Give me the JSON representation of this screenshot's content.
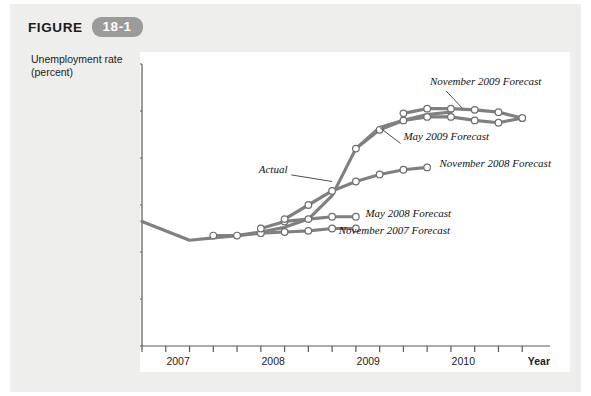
{
  "figure": {
    "label": "FIGURE",
    "number": "18-1",
    "badge_color": "#9b9b99",
    "card_background": "#eeeeec",
    "panel_background": "#ffffff"
  },
  "chart_data": {
    "type": "line",
    "title": "",
    "xlabel": "Year",
    "ylabel": "Unemployment rate (percent)",
    "ylim": [
      0,
      12
    ],
    "yticks": [
      0,
      2,
      4,
      6,
      8,
      10,
      12
    ],
    "xlim": [
      2006.75,
      2011.0
    ],
    "xticks": [
      2006.75,
      2007.0,
      2007.25,
      2007.5,
      2007.75,
      2008.0,
      2008.25,
      2008.5,
      2008.75,
      2009.0,
      2009.25,
      2009.5,
      2009.75,
      2010.0,
      2010.25,
      2010.5,
      2010.75
    ],
    "xtick_labels": [
      "2007",
      "2008",
      "2009",
      "2010"
    ],
    "xtick_label_positions": [
      2007.0,
      2008.0,
      2009.0,
      2010.0
    ],
    "grid": false,
    "legend_position": "inline-annotations",
    "line_color": "#808080",
    "marker_fill": "#ffffff",
    "marker_edge": "#6e6e6e",
    "series": [
      {
        "name": "Actual",
        "label": "Actual",
        "markers": false,
        "x": [
          2006.75,
          2007.25,
          2007.5,
          2007.75,
          2008.0,
          2008.25,
          2008.5,
          2008.75,
          2009.0,
          2009.25,
          2009.5,
          2009.75,
          2010.0
        ],
        "values": [
          5.3,
          4.5,
          4.6,
          4.7,
          4.85,
          5.05,
          5.4,
          6.4,
          8.4,
          9.3,
          9.6,
          9.85,
          9.95
        ]
      },
      {
        "name": "November 2007 Forecast",
        "label": "November 2007 Forecast",
        "markers": true,
        "x": [
          2007.5,
          2007.75,
          2008.0,
          2008.25,
          2008.5,
          2008.75,
          2009.0
        ],
        "values": [
          4.7,
          4.7,
          4.8,
          4.85,
          4.9,
          5.0,
          5.0
        ]
      },
      {
        "name": "May 2008 Forecast",
        "label": "May 2008 Forecast",
        "markers": true,
        "x": [
          2008.0,
          2008.25,
          2008.5,
          2008.75,
          2009.0
        ],
        "values": [
          5.0,
          5.3,
          5.4,
          5.5,
          5.5
        ]
      },
      {
        "name": "November 2008 Forecast",
        "label": "November 2008 Forecast",
        "markers": true,
        "x": [
          2008.25,
          2008.5,
          2008.75,
          2009.0,
          2009.25,
          2009.5,
          2009.75
        ],
        "values": [
          5.4,
          6.0,
          6.6,
          7.0,
          7.3,
          7.5,
          7.6
        ]
      },
      {
        "name": "May 2009 Forecast",
        "label": "May 2009 Forecast",
        "markers": true,
        "x": [
          2009.0,
          2009.25,
          2009.5,
          2009.75,
          2010.0,
          2010.25,
          2010.5,
          2010.75
        ],
        "values": [
          8.4,
          9.2,
          9.6,
          9.75,
          9.75,
          9.6,
          9.5,
          9.7
        ]
      },
      {
        "name": "November 2009 Forecast",
        "label": "November 2009 Forecast",
        "markers": true,
        "x": [
          2009.5,
          2009.75,
          2010.0,
          2010.25,
          2010.5,
          2010.75
        ],
        "values": [
          9.9,
          10.1,
          10.1,
          10.05,
          9.95,
          9.7
        ]
      }
    ],
    "annotations": [
      {
        "text": "November 2009 Forecast",
        "x": 2009.78,
        "y": 11.1
      },
      {
        "text": "May 2009 Forecast",
        "x": 2009.5,
        "y": 8.75
      },
      {
        "text": "November 2008 Forecast",
        "x": 2009.88,
        "y": 7.6
      },
      {
        "text": "May 2008 Forecast",
        "x": 2009.1,
        "y": 5.5
      },
      {
        "text": "November 2007 Forecast",
        "x": 2008.82,
        "y": 4.78
      },
      {
        "text": "Actual",
        "x": 2008.28,
        "y": 7.35
      }
    ]
  }
}
